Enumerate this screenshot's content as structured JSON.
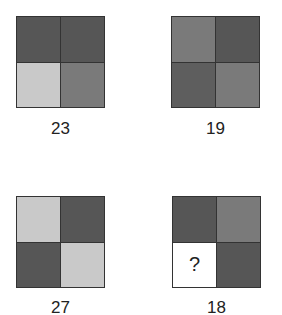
{
  "puzzle": {
    "colors": {
      "dark": "#565656",
      "medium": "#7a7a7a",
      "light": "#c9c9c9",
      "blank": "#ffffff"
    },
    "grids": [
      {
        "cells": [
          "dark",
          "dark",
          "light",
          "medium"
        ],
        "label": "23"
      },
      {
        "cells": [
          "medium",
          "dark",
          "dark",
          "medium"
        ],
        "label": "19"
      },
      {
        "cells": [
          "light",
          "dark",
          "dark",
          "light"
        ],
        "label": "27"
      },
      {
        "cells": [
          "dark",
          "medium",
          "blank",
          "dark"
        ],
        "label": "18",
        "unknown_cell_index": 2,
        "unknown_symbol": "?"
      }
    ]
  }
}
